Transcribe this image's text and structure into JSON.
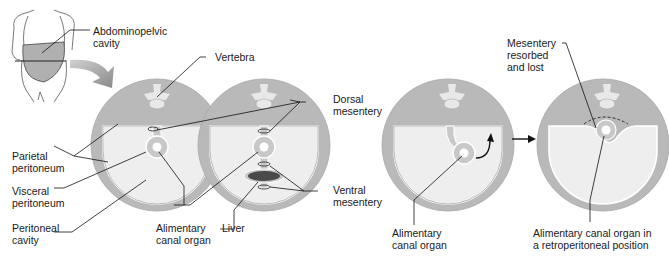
{
  "labels": {
    "abdominopelvic_cavity": "Abdominopelvic\ncavity",
    "vertebra": "Vertebra",
    "dorsal_mesentery": "Dorsal\nmesentery",
    "parietal_peritoneum": "Parietal\nperitoneum",
    "visceral_peritoneum": "Visceral\nperitoneum",
    "peritoneal_cavity": "Peritoneal\ncavity",
    "alimentary_canal_organ_1": "Alimentary\ncanal organ",
    "liver": "Liver",
    "ventral_mesentery": "Ventral\nmesentery",
    "alimentary_canal_organ_2": "Alimentary\ncanal organ",
    "mesentery_resorbed": "Mesentery\nresorbed\nand lost",
    "retroperitoneal": "Alimentary canal organ in\na retroperitoneal position"
  },
  "colors": {
    "body_wall": "#b9b9b9",
    "peritoneal_cavity": "#eeeeee",
    "organ": "#c8c8c8",
    "liver": "#4a4a4a",
    "line": "#1a1a1a",
    "arrow": "#9a9a9a"
  }
}
